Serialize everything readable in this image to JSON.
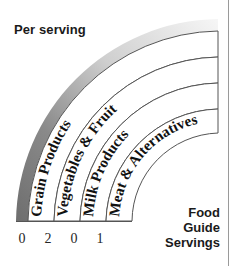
{
  "graphic": {
    "type": "food-guide-rainbow",
    "heading": "Per serving",
    "footer_lines": [
      "Food",
      "Guide",
      "Servings"
    ],
    "footer_text": "Food Guide Servings",
    "outer_band_color_dark": "#6e6e6e",
    "outer_band_color_light": "#f2f2f2",
    "band_fill": "#ffffff",
    "band_stroke": "#555555",
    "text_color": "#111111",
    "bands": [
      {
        "label": "Grain Products",
        "servings": "0"
      },
      {
        "label": "Vegetables & Fruit",
        "servings": "2"
      },
      {
        "label": "Milk Products",
        "servings": "0"
      },
      {
        "label": "Meat & Alternatives",
        "servings": "1"
      }
    ]
  }
}
